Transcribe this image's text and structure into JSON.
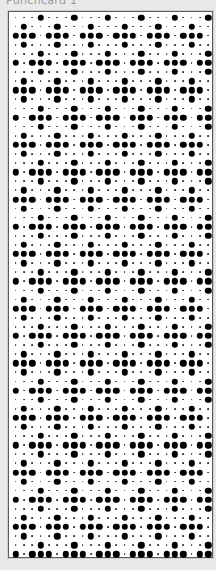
{
  "header": {
    "title": "Punchcard 1"
  },
  "card": {
    "columns": 24,
    "rows": 60,
    "col_pitch": 8.39,
    "row_pitch": 9.1,
    "origin_x": 6.5,
    "origin_y": 5.5,
    "colors": {
      "background": "#ffffff",
      "border": "#5a5a5a",
      "hole": "#000000",
      "page": "#e9e9e9"
    },
    "legend": {
      "punched": "●",
      "unpunched": "·"
    },
    "row_pattern_cycle": [
      "A",
      "B",
      "C",
      "B",
      "A",
      "D"
    ],
    "patterns": {
      "A": "···●···●···●···●···●···●",
      "B": "·●···●···●···●···●···●··",
      "C": "●●●·●●●·●●●·●●●·●●●·●●●·",
      "D": "●·●●●·●●●·●●●·●●●·●●●·●●"
    }
  }
}
